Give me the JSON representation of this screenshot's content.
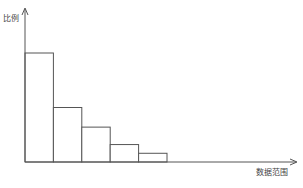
{
  "chart_data": {
    "type": "bar",
    "title": "",
    "xlabel": "数据范围",
    "ylabel": "比例",
    "categories": [
      "1",
      "2",
      "3",
      "4",
      "5"
    ],
    "values": [
      100,
      50,
      32,
      16,
      8
    ],
    "ylim": [
      0,
      120
    ],
    "grid": false,
    "legend": null,
    "axis_ticks_shown": false,
    "bar_style": "outlined, no fill, adjacent (histogram)",
    "colors": {
      "stroke": "#555555",
      "axis": "#555555",
      "fill": "#ffffff"
    }
  }
}
